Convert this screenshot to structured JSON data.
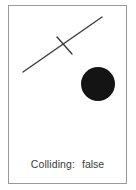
{
  "panel": {
    "background_color": "#ffffff",
    "border_color": "#9a9a9a"
  },
  "scene": {
    "title": "collision-detection-scene",
    "stroke_color": "#3d3d3d",
    "fill_color": "#141414",
    "segments": [
      {
        "name": "long-segment",
        "x1": 14,
        "y1": 66,
        "x2": 93,
        "y2": 11,
        "stroke_width": 1.4
      },
      {
        "name": "short-segment",
        "x1": 48,
        "y1": 31,
        "x2": 63,
        "y2": 48,
        "stroke_width": 1.4
      }
    ],
    "circle": {
      "name": "filled-circle",
      "cx": 89,
      "cy": 78,
      "r": 17,
      "fill": "#141414"
    }
  },
  "status": {
    "label": "Colliding:",
    "value": "false"
  }
}
